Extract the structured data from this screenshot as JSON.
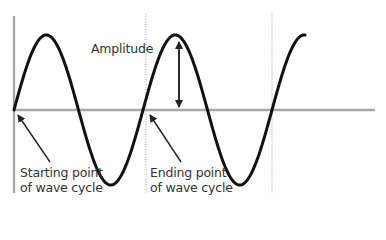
{
  "diagram": {
    "colors": {
      "wave": "#111111",
      "axis": "#a8a8a8",
      "guide": "#9a9a9a",
      "arrow": "#222222",
      "text": "#333333"
    },
    "labels": {
      "amplitude": "Amplitude",
      "start_line1": "Starting point",
      "start_line2": "of wave cycle",
      "end_line1": "Ending point",
      "end_line2": "of wave cycle"
    },
    "wave": {
      "type": "sine",
      "origin_x": 14,
      "baseline_y": 110,
      "amplitude_px": 75,
      "period_px": 129,
      "end_x": 305
    },
    "guides": {
      "cycle_start_x": 14,
      "cycle_end_x": 146,
      "next_cycle_end_x": 272
    }
  }
}
